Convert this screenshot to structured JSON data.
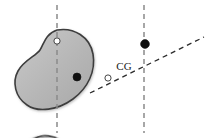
{
  "figure": {
    "type": "mechanics-diagram",
    "title": "",
    "background_color": "#ffffff",
    "canvas": {
      "width": 208,
      "height": 138
    },
    "style": {
      "body_fill": "#b4b4b4",
      "body_fill_light": "#c9c9c9",
      "body_outline": "#3d3d3d",
      "body_outline_width": 1.6,
      "axis_dash_color": "#8a8a8a",
      "axis_dash_color_dark": "#2b2b2b",
      "dash_pattern": "5 4",
      "marker_filled_color": "#111111",
      "marker_open_fill": "#ffffff",
      "marker_open_stroke": "#333333"
    },
    "panels": [
      {
        "id": "left-panel",
        "name": "bean-body-unrotated",
        "label": "",
        "body": {
          "name": "bean-shape-left",
          "rotation_deg": 0,
          "center": {
            "x": 52,
            "y": 78
          },
          "path": "M 57 30 C 74 27 90 37 93 54 C 96 71 88 88 73 99 C 58 110 38 113 27 105 C 15 97 12 82 18 71 C 24 60 36 56 40 50 C 44 44 45 34 57 30 Z"
        },
        "axes": [
          {
            "name": "vertical-axis-left",
            "kind": "dashed-vertical",
            "x1": 57,
            "y1": 5,
            "x2": 57,
            "y2": 133,
            "color": "#8a8a8a"
          }
        ],
        "markers": [
          {
            "name": "open-point-left",
            "kind": "open-circle",
            "x": 57,
            "y": 41,
            "r": 3.1,
            "label": ""
          },
          {
            "name": "filled-point-left",
            "kind": "filled-circle",
            "x": 77,
            "y": 77,
            "r": 4.0,
            "label": ""
          }
        ]
      },
      {
        "id": "right-panel",
        "name": "bean-body-rotated",
        "label": "",
        "body": {
          "name": "bean-shape-right",
          "rotation_deg": 95,
          "center": {
            "x": 147,
            "y": 72
          },
          "path": "M 57 30 C 74 27 90 37 93 54 C 96 71 88 88 73 99 C 58 110 38 113 27 105 C 15 97 12 82 18 71 C 24 60 36 56 40 50 C 44 44 45 34 57 30 Z"
        },
        "axes": [
          {
            "name": "vertical-axis-right",
            "kind": "dashed-vertical",
            "x1": 144,
            "y1": 5,
            "x2": 144,
            "y2": 133,
            "color": "#8a8a8a"
          },
          {
            "name": "inclined-axis-right",
            "kind": "dashed-inclined",
            "x1": 90,
            "y1": 93,
            "x2": 204,
            "y2": 37,
            "color": "#2b2b2b"
          }
        ],
        "markers": [
          {
            "name": "filled-point-right",
            "kind": "filled-circle",
            "x": 145,
            "y": 44,
            "r": 4.4,
            "label": ""
          },
          {
            "name": "open-point-right",
            "kind": "open-circle",
            "x": 108,
            "y": 78,
            "r": 3.1,
            "label": ""
          }
        ],
        "annotations": [
          {
            "name": "cg-label",
            "text": "CG",
            "x": 124,
            "y": 70
          }
        ]
      }
    ]
  }
}
